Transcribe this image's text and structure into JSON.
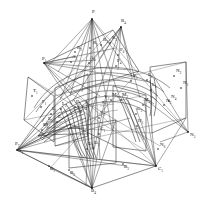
{
  "figure": {
    "background_color": "#ffffff",
    "ink_color": "#1b1b1b",
    "width": 207,
    "height": 208
  },
  "labels": [
    {
      "id": "P",
      "base": "P",
      "sub": "",
      "x": 92,
      "y": 13
    },
    {
      "id": "R4",
      "base": "R",
      "sub": "4",
      "x": 121,
      "y": 22
    },
    {
      "id": "P1",
      "base": "P",
      "sub": "1",
      "x": 42,
      "y": 60
    },
    {
      "id": "R2",
      "base": "R",
      "sub": "2",
      "x": 77,
      "y": 49
    },
    {
      "id": "R1",
      "base": "R",
      "sub": "1",
      "x": 93,
      "y": 44
    },
    {
      "id": "R3",
      "base": "R",
      "sub": "3",
      "x": 103,
      "y": 41
    },
    {
      "id": "R5",
      "base": "R",
      "sub": "5",
      "x": 112,
      "y": 39
    },
    {
      "id": "A2",
      "base": "A",
      "sub": "2",
      "x": 72,
      "y": 58
    },
    {
      "id": "A3",
      "base": "A",
      "sub": "3",
      "x": 90,
      "y": 59
    },
    {
      "id": "P6",
      "base": "P",
      "sub": "6",
      "x": 120,
      "y": 51
    },
    {
      "id": "P4",
      "base": "P",
      "sub": "4",
      "x": 117,
      "y": 62
    },
    {
      "id": "P5",
      "base": "P",
      "sub": "5",
      "x": 133,
      "y": 77
    },
    {
      "id": "L6",
      "base": "L",
      "sub": "6",
      "x": 148,
      "y": 76
    },
    {
      "id": "L5",
      "base": "L",
      "sub": "5",
      "x": 152,
      "y": 86
    },
    {
      "id": "N2",
      "base": "N",
      "sub": "2",
      "x": 176,
      "y": 72
    },
    {
      "id": "N1",
      "base": "N",
      "sub": "1",
      "x": 183,
      "y": 84
    },
    {
      "id": "N4",
      "base": "N",
      "sub": "4",
      "x": 171,
      "y": 98
    },
    {
      "id": "N3",
      "base": "N",
      "sub": "3",
      "x": 166,
      "y": 102
    },
    {
      "id": "N5",
      "base": "N",
      "sub": "5",
      "x": 190,
      "y": 136
    },
    {
      "id": "N6",
      "base": "N",
      "sub": "6",
      "x": 160,
      "y": 146
    },
    {
      "id": "T1",
      "base": "T",
      "sub": "1",
      "x": 33,
      "y": 92
    },
    {
      "id": "F1",
      "base": "F",
      "sub": "1",
      "x": 42,
      "y": 103
    },
    {
      "id": "L1",
      "base": "L",
      "sub": "1",
      "x": 52,
      "y": 110
    },
    {
      "id": "L2",
      "base": "L",
      "sub": "2",
      "x": 62,
      "y": 105
    },
    {
      "id": "L3",
      "base": "L",
      "sub": "3",
      "x": 76,
      "y": 103
    },
    {
      "id": "L4",
      "base": "L",
      "sub": "4",
      "x": 82,
      "y": 108
    },
    {
      "id": "E1",
      "base": "E",
      "sub": "1",
      "x": 48,
      "y": 120
    },
    {
      "id": "E2",
      "base": "E",
      "sub": "2",
      "x": 58,
      "y": 118
    },
    {
      "id": "K1",
      "base": "K",
      "sub": "1",
      "x": 43,
      "y": 126
    },
    {
      "id": "V1",
      "base": "V",
      "sub": "1",
      "x": 100,
      "y": 114
    },
    {
      "id": "V2",
      "base": "V",
      "sub": "2",
      "x": 104,
      "y": 98
    },
    {
      "id": "M1",
      "base": "M",
      "sub": "1",
      "x": 112,
      "y": 96
    },
    {
      "id": "M2",
      "base": "M",
      "sub": "2",
      "x": 122,
      "y": 96
    },
    {
      "id": "M3",
      "base": "M",
      "sub": "3",
      "x": 144,
      "y": 101
    },
    {
      "id": "G1",
      "base": "G",
      "sub": "1",
      "x": 100,
      "y": 130
    },
    {
      "id": "G2",
      "base": "G",
      "sub": "2",
      "x": 137,
      "y": 110
    },
    {
      "id": "H1",
      "base": "H",
      "sub": "1",
      "x": 138,
      "y": 122
    },
    {
      "id": "D1",
      "base": "D",
      "sub": "1",
      "x": 88,
      "y": 145
    },
    {
      "id": "D2",
      "base": "D",
      "sub": "2",
      "x": 94,
      "y": 144
    },
    {
      "id": "P7",
      "base": "P",
      "sub": "7",
      "x": 15,
      "y": 145
    },
    {
      "id": "A1",
      "base": "A",
      "sub": "1",
      "x": 18,
      "y": 152
    },
    {
      "id": "B1",
      "base": "B",
      "sub": "1",
      "x": 50,
      "y": 170
    },
    {
      "id": "B2",
      "base": "B",
      "sub": "2",
      "x": 70,
      "y": 174
    },
    {
      "id": "B3",
      "base": "B",
      "sub": "3",
      "x": 124,
      "y": 168
    },
    {
      "id": "B4",
      "base": "B",
      "sub": "4",
      "x": 91,
      "y": 192
    },
    {
      "id": "C1",
      "base": "C",
      "sub": "1",
      "x": 158,
      "y": 170
    }
  ],
  "points": [
    {
      "id": "apexP",
      "x": 92,
      "y": 19
    },
    {
      "id": "apexR4",
      "x": 121,
      "y": 27
    },
    {
      "id": "apexP1",
      "x": 44,
      "y": 63
    },
    {
      "id": "apexP7",
      "x": 17,
      "y": 150
    },
    {
      "id": "apexB4",
      "x": 92,
      "y": 188
    },
    {
      "id": "apexC1",
      "x": 156,
      "y": 166
    },
    {
      "id": "apexN5",
      "x": 188,
      "y": 132
    }
  ]
}
